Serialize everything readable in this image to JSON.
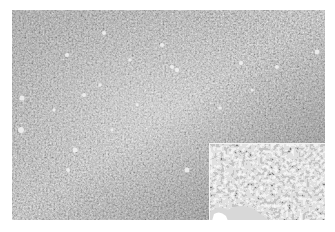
{
  "figure": {
    "type": "grayscale histology micrograph",
    "colors": {
      "background": "#ffffff",
      "tissue_dark": "#2a2a2a",
      "tissue_mid": "#7a7a7a",
      "tissue_light": "#e8e8e8",
      "inset_border": "#f4f4f4"
    },
    "inset": {
      "position": "bottom-right",
      "description": "Higher-magnification view of dark nuclei among pale cells, with pale stroma at bottom left"
    }
  }
}
